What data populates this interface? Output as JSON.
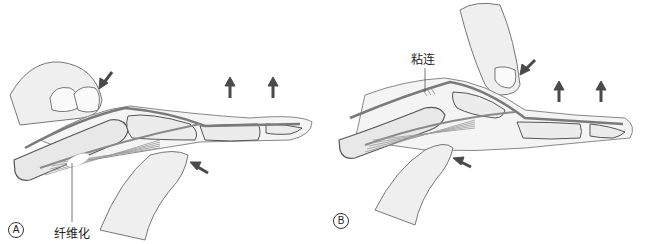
{
  "figure": {
    "panels": [
      {
        "id": "A",
        "letter": "A",
        "label": "纤维化",
        "description": "Examiner pinches proximal finger segment; arrows indicate pressure and upward motion of distal finger"
      },
      {
        "id": "B",
        "letter": "B",
        "label": "粘连",
        "description": "Examiner presses on dorsal and palmar side near PIP joint; adhesion of extensor tendon indicated"
      }
    ],
    "colors": {
      "outline": "#555555",
      "skin": "#f1f1f1",
      "bone": "#e6e6e6",
      "tendon": "#8a8a8a",
      "arrow": "#4a4a4a",
      "muscle": "#9a9a9a"
    }
  }
}
